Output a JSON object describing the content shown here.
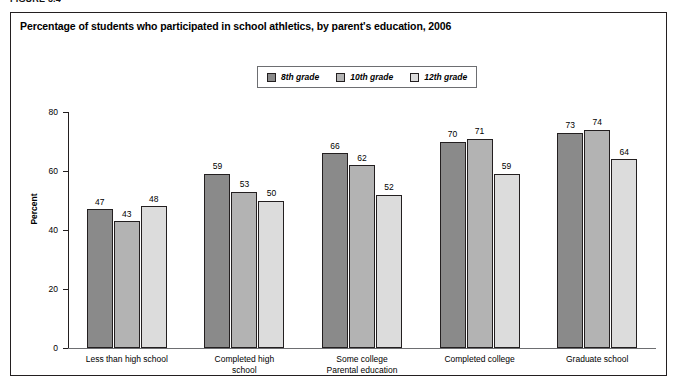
{
  "figure_caption": "FIGURE 3.4",
  "chart_title": "Percentage of students who participated in school athletics, by parent's education, 2006",
  "legend": {
    "items": [
      {
        "label": "8th grade",
        "color": "#8a8a8a"
      },
      {
        "label": "10th grade",
        "color": "#b3b3b3"
      },
      {
        "label": "12th grade",
        "color": "#dcdcdc"
      }
    ]
  },
  "axis": {
    "y_title": "Percent",
    "y_ticks": [
      "0",
      "20",
      "40",
      "60",
      "80"
    ],
    "x_title": "Parental education"
  },
  "chart_data": {
    "type": "bar",
    "title": "Percentage of students who participated in school athletics, by parent's education, 2006",
    "xlabel": "Parental education",
    "ylabel": "Percent",
    "ylim": [
      0,
      80
    ],
    "yticks": [
      0,
      20,
      40,
      60,
      80
    ],
    "grid": false,
    "legend_position": "top-center",
    "categories": [
      "Less than high school",
      "Completed high school",
      "Some college",
      "Completed college",
      "Graduate school"
    ],
    "category_lines": [
      [
        "Less than high school"
      ],
      [
        "Completed high",
        "school"
      ],
      [
        "Some college"
      ],
      [
        "Completed college"
      ],
      [
        "Graduate school"
      ]
    ],
    "series": [
      {
        "name": "8th grade",
        "color": "#8a8a8a",
        "values": [
          47,
          59,
          66,
          70,
          73
        ]
      },
      {
        "name": "10th grade",
        "color": "#b3b3b3",
        "values": [
          43,
          53,
          62,
          71,
          74
        ]
      },
      {
        "name": "12th grade",
        "color": "#dcdcdc",
        "values": [
          48,
          50,
          52,
          59,
          64
        ]
      }
    ]
  }
}
